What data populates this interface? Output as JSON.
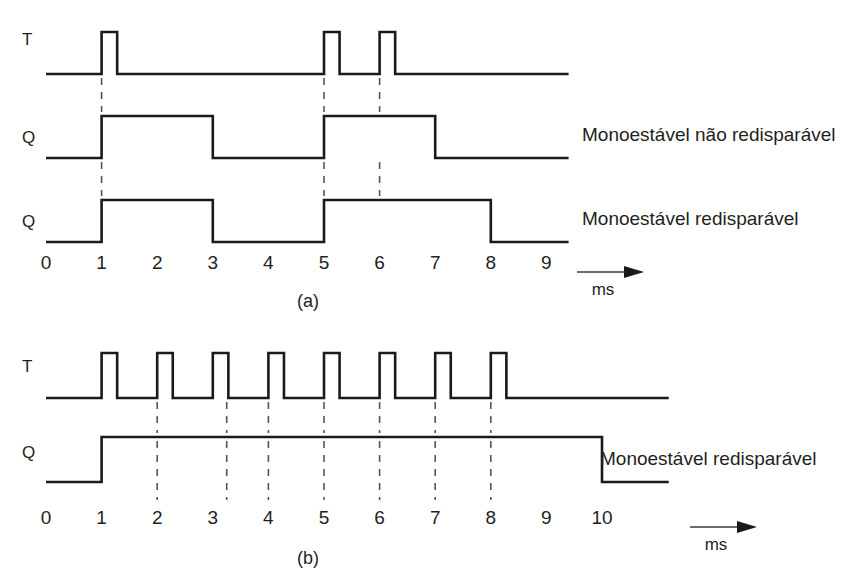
{
  "figure": {
    "caption_a": "(a)",
    "caption_b": "(b)",
    "unit": "ms",
    "stroke_color": "#1a1a1a",
    "guide_color": "#555555",
    "background": "#ffffff"
  },
  "panel_a": {
    "caption": "(a)",
    "unit": "ms",
    "signals": [
      {
        "name": "T",
        "label": "T",
        "annotation": ""
      },
      {
        "name": "Q-non-retriggerable",
        "label": "Q",
        "annotation": "Monoestável não redisparável"
      },
      {
        "name": "Q-retriggerable",
        "label": "Q",
        "annotation": "Monoestável redisparável"
      }
    ],
    "ticks": [
      "0",
      "1",
      "2",
      "3",
      "4",
      "5",
      "6",
      "7",
      "8",
      "9"
    ],
    "guides": [
      1,
      5,
      6
    ]
  },
  "panel_b": {
    "caption": "(b)",
    "unit": "ms",
    "signals": [
      {
        "name": "T",
        "label": "T",
        "annotation": ""
      },
      {
        "name": "Q-retriggerable",
        "label": "Q",
        "annotation": "Monoestável redisparável"
      }
    ],
    "ticks": [
      "0",
      "1",
      "2",
      "3",
      "4",
      "5",
      "6",
      "7",
      "8",
      "9",
      "10"
    ],
    "guides": [
      2,
      3.25,
      4,
      5,
      6,
      7,
      8
    ]
  },
  "chart_data": {
    "type": "line",
    "xlabel": "ms",
    "ylabel": "",
    "panels": [
      {
        "id": "a",
        "caption": "(a)",
        "xlim": [
          0,
          9
        ],
        "xticks": [
          0,
          1,
          2,
          3,
          4,
          5,
          6,
          7,
          8,
          9
        ],
        "xunit": "ms",
        "dashed_guides": [
          1,
          5,
          6
        ],
        "series": [
          {
            "name": "T",
            "label": "T",
            "annotation": "",
            "description": "Trigger pulses: narrow positive pulses at t=1, t=5 and t=6",
            "pulses": [
              {
                "start": 1.0,
                "end": 1.28
              },
              {
                "start": 5.0,
                "end": 5.28
              },
              {
                "start": 6.0,
                "end": 6.28
              }
            ],
            "transitions": [
              {
                "t": 0.0,
                "level": 0
              },
              {
                "t": 1.0,
                "level": 1
              },
              {
                "t": 1.28,
                "level": 0
              },
              {
                "t": 5.0,
                "level": 1
              },
              {
                "t": 5.28,
                "level": 0
              },
              {
                "t": 6.0,
                "level": 1
              },
              {
                "t": 6.28,
                "level": 0
              },
              {
                "t": 9.4,
                "level": 0
              }
            ]
          },
          {
            "name": "Q-non-retriggerable",
            "label": "Q",
            "annotation": "Monoestável não redisparável",
            "description": "Output high 1 to 3 ms and 5 to 7 ms; second trigger at 6 ms is ignored",
            "pulses": [
              {
                "start": 1.0,
                "end": 3.0
              },
              {
                "start": 5.0,
                "end": 7.0
              }
            ],
            "transitions": [
              {
                "t": 0.0,
                "level": 0
              },
              {
                "t": 1.0,
                "level": 1
              },
              {
                "t": 3.0,
                "level": 0
              },
              {
                "t": 5.0,
                "level": 1
              },
              {
                "t": 7.0,
                "level": 0
              },
              {
                "t": 9.4,
                "level": 0
              }
            ]
          },
          {
            "name": "Q-retriggerable",
            "label": "Q",
            "annotation": "Monoestável redisparável",
            "description": "Output high 1 to 3 ms and 5 to 8 ms; trigger at 6 ms restarts the 2 ms period",
            "pulses": [
              {
                "start": 1.0,
                "end": 3.0
              },
              {
                "start": 5.0,
                "end": 8.0
              }
            ],
            "transitions": [
              {
                "t": 0.0,
                "level": 0
              },
              {
                "t": 1.0,
                "level": 1
              },
              {
                "t": 3.0,
                "level": 0
              },
              {
                "t": 5.0,
                "level": 1
              },
              {
                "t": 8.0,
                "level": 0
              },
              {
                "t": 9.4,
                "level": 0
              }
            ]
          }
        ]
      },
      {
        "id": "b",
        "caption": "(b)",
        "xlim": [
          0,
          10
        ],
        "xticks": [
          0,
          1,
          2,
          3,
          4,
          5,
          6,
          7,
          8,
          9,
          10
        ],
        "xunit": "ms",
        "dashed_guides": [
          2,
          3.25,
          4,
          5,
          6,
          7,
          8
        ],
        "series": [
          {
            "name": "T",
            "label": "T",
            "annotation": "",
            "description": "Eight narrow trigger pulses spaced about 1 ms apart starting at t=1",
            "pulses": [
              {
                "start": 1.0,
                "end": 1.28
              },
              {
                "start": 2.0,
                "end": 2.28
              },
              {
                "start": 3.0,
                "end": 3.28
              },
              {
                "start": 4.0,
                "end": 4.28
              },
              {
                "start": 5.0,
                "end": 5.28
              },
              {
                "start": 6.0,
                "end": 6.28
              },
              {
                "start": 7.0,
                "end": 7.28
              },
              {
                "start": 8.0,
                "end": 8.28
              }
            ],
            "transitions": [
              {
                "t": 0.0,
                "level": 0
              },
              {
                "t": 1.0,
                "level": 1
              },
              {
                "t": 1.28,
                "level": 0
              },
              {
                "t": 2.0,
                "level": 1
              },
              {
                "t": 2.28,
                "level": 0
              },
              {
                "t": 3.0,
                "level": 1
              },
              {
                "t": 3.28,
                "level": 0
              },
              {
                "t": 4.0,
                "level": 1
              },
              {
                "t": 4.28,
                "level": 0
              },
              {
                "t": 5.0,
                "level": 1
              },
              {
                "t": 5.28,
                "level": 0
              },
              {
                "t": 6.0,
                "level": 1
              },
              {
                "t": 6.28,
                "level": 0
              },
              {
                "t": 7.0,
                "level": 1
              },
              {
                "t": 7.28,
                "level": 0
              },
              {
                "t": 8.0,
                "level": 1
              },
              {
                "t": 8.28,
                "level": 0
              },
              {
                "t": 11.2,
                "level": 0
              }
            ]
          },
          {
            "name": "Q-retriggerable",
            "label": "Q",
            "annotation": "Monoestável redisparável",
            "description": "Output stays high from 1 ms to 10 ms because every trigger retriggers the timer",
            "pulses": [
              {
                "start": 1.0,
                "end": 10.0
              }
            ],
            "transitions": [
              {
                "t": 0.0,
                "level": 0
              },
              {
                "t": 1.0,
                "level": 1
              },
              {
                "t": 10.0,
                "level": 0
              },
              {
                "t": 11.2,
                "level": 0
              }
            ]
          }
        ]
      }
    ]
  }
}
